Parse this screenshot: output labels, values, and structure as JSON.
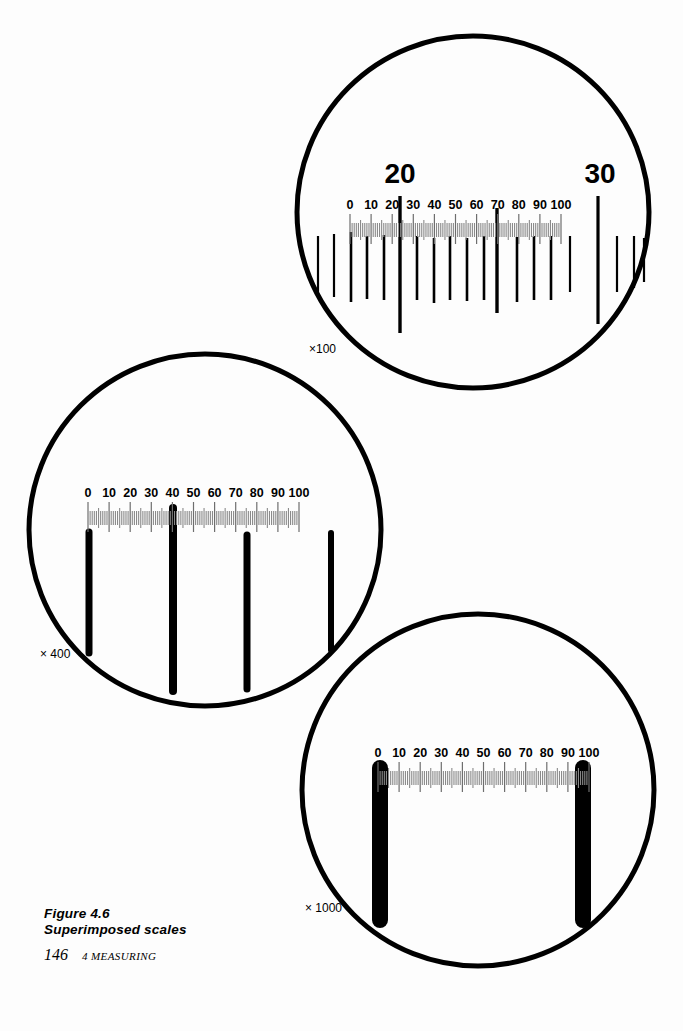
{
  "figure": {
    "caption_line1": "Figure 4.6",
    "caption_line2": "Superimposed scales",
    "caption_text": "Figure 4.6\nSuperimposed scales",
    "page_number": "146",
    "chapter_label": "4 MEASURING",
    "ink_color": "#000000",
    "paper_color": "#ffffff",
    "eyepiece_tick_color": "#808080"
  },
  "chart_data": {
    "type": "diagram",
    "title": "Superimposed scales",
    "eyepiece_scale": {
      "labels": [
        "0",
        "10",
        "20",
        "30",
        "40",
        "50",
        "60",
        "70",
        "80",
        "90",
        "100"
      ],
      "values": [
        0,
        10,
        20,
        30,
        40,
        50,
        60,
        70,
        80,
        90,
        100
      ],
      "minor_divisions_per_major": 10,
      "total_divisions": 100
    },
    "views": [
      {
        "name": "view-x100",
        "magnification_label": "×100",
        "magnification": 100,
        "circle": {
          "cx": 473,
          "cy": 212,
          "r": 176
        },
        "eyepiece_scale": {
          "x_start": 350,
          "x_end": 561,
          "y_baseline": 230
        },
        "stage_micrometer": {
          "labeled_divisions": [
            "20",
            "30"
          ],
          "label_positions_eyepiece": [
            20,
            98
          ],
          "line_spacing_eyepiece_units": 7.8,
          "lines": [
            {
              "eyepiece_pos": -31.2,
              "length": "short"
            },
            {
              "eyepiece_pos": -23.4,
              "length": "short"
            },
            {
              "eyepiece_pos": -15.6,
              "length": "medium"
            },
            {
              "eyepiece_pos": -7.8,
              "length": "medium"
            },
            {
              "eyepiece_pos": 0.0,
              "length": "medium"
            },
            {
              "eyepiece_pos": 7.8,
              "length": "medium"
            },
            {
              "eyepiece_pos": 15.6,
              "length": "medium"
            },
            {
              "eyepiece_pos": 20.0,
              "length": "long",
              "label": "20"
            },
            {
              "eyepiece_pos": 27.8,
              "length": "medium"
            },
            {
              "eyepiece_pos": 35.6,
              "length": "medium"
            },
            {
              "eyepiece_pos": 43.4,
              "length": "medium"
            },
            {
              "eyepiece_pos": 51.2,
              "length": "medium"
            },
            {
              "eyepiece_pos": 59.0,
              "length": "medium"
            },
            {
              "eyepiece_pos": 70.0,
              "length": "long"
            },
            {
              "eyepiece_pos": 74.6,
              "length": "medium"
            },
            {
              "eyepiece_pos": 82.4,
              "length": "medium"
            },
            {
              "eyepiece_pos": 90.2,
              "length": "medium"
            },
            {
              "eyepiece_pos": 98.0,
              "length": "long",
              "label": "30"
            },
            {
              "eyepiece_pos": 105.8,
              "length": "short"
            },
            {
              "eyepiece_pos": 113.6,
              "length": "short"
            },
            {
              "eyepiece_pos": 121.4,
              "length": "short"
            }
          ]
        }
      },
      {
        "name": "view-x400",
        "magnification_label": "× 400",
        "magnification": 400,
        "circle": {
          "cx": 205,
          "cy": 530,
          "r": 176
        },
        "eyepiece_scale": {
          "x_start": 88,
          "x_end": 299,
          "y_baseline": 518
        },
        "stage_micrometer": {
          "line_width_px": 7,
          "lines": [
            {
              "eyepiece_pos": 0,
              "length": "long"
            },
            {
              "eyepiece_pos": 40,
              "length": "long"
            },
            {
              "eyepiece_pos": 80,
              "length": "long"
            },
            {
              "eyepiece_pos": 117,
              "length": "medium"
            }
          ]
        }
      },
      {
        "name": "view-x1000",
        "magnification_label": "× 1000",
        "magnification": 1000,
        "circle": {
          "cx": 478,
          "cy": 790,
          "r": 176
        },
        "eyepiece_scale": {
          "x_start": 378,
          "x_end": 589,
          "y_baseline": 778
        },
        "stage_micrometer": {
          "line_width_px": 16,
          "lines": [
            {
              "eyepiece_pos": 0,
              "length": "long"
            },
            {
              "eyepiece_pos": 100,
              "length": "long"
            }
          ]
        }
      }
    ]
  }
}
